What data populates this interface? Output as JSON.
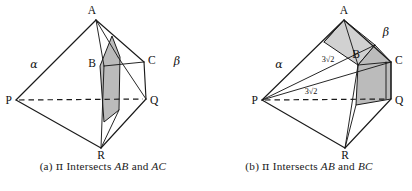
{
  "figures": [
    {
      "id": "figure-a",
      "caption": {
        "tag": "(a)",
        "symbol": "π",
        "verb": "Intersects",
        "edge1": "AB",
        "conj": "and",
        "edge2": "AC",
        "full": "(a) π Intersects AB and AC"
      },
      "labels": {
        "A": "A",
        "B": "B",
        "C": "C",
        "P": "P",
        "Q": "Q",
        "R": "R",
        "alpha": "α",
        "beta": "β"
      },
      "measures": []
    },
    {
      "id": "figure-b",
      "caption": {
        "tag": "(b)",
        "symbol": "π",
        "verb": "Intersects",
        "edge1": "AB",
        "conj": "and",
        "edge2": "BC",
        "full": "(b) π Intersects AB and BC"
      },
      "labels": {
        "A": "A",
        "B": "B",
        "C": "C",
        "P": "P",
        "Q": "Q",
        "R": "R",
        "alpha": "α",
        "beta": "β"
      },
      "measures": [
        {
          "name": "measure-pb",
          "value": "3√2"
        },
        {
          "name": "measure-pq",
          "value": "3√2"
        }
      ]
    }
  ],
  "colors": {
    "ink": "#1a1a1a",
    "shade": "#a8a8a8",
    "background": "#ffffff"
  }
}
